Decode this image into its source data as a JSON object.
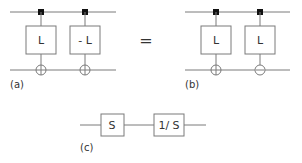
{
  "diagram": {
    "a": {
      "label": "(a)",
      "blocks": [
        "L",
        "- L"
      ],
      "sums": [
        "plus",
        "plus"
      ]
    },
    "equals": "=",
    "b": {
      "label": "(b)",
      "blocks": [
        "L",
        "L"
      ],
      "sums": [
        "plus",
        "minus"
      ]
    },
    "c": {
      "label": "(c)",
      "blocks": [
        "S",
        "1/ S"
      ]
    }
  }
}
